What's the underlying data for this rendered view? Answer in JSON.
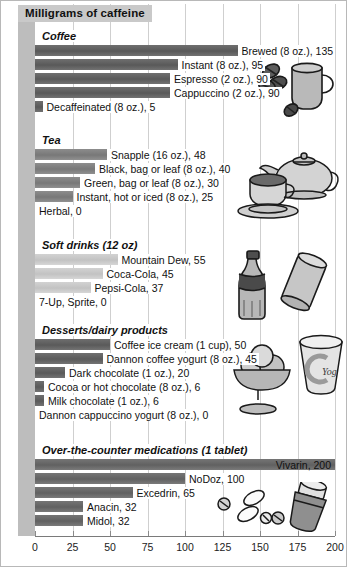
{
  "title": "Milligrams of caffeine",
  "chart_data": {
    "type": "bar",
    "title": "Milligrams of caffeine",
    "xlabel": "",
    "ylabel": "",
    "xlim": [
      0,
      200
    ],
    "orientation": "horizontal",
    "grid": true,
    "legend": "none",
    "xticks": [
      "0",
      "25",
      "50",
      "75",
      "100",
      "125",
      "150",
      "175",
      "200"
    ],
    "xtick_values": [
      0,
      25,
      50,
      75,
      100,
      125,
      150,
      175,
      200
    ],
    "groups": [
      {
        "name": "Coffee",
        "heading": "Coffee",
        "categories": [
          "Brewed (8 oz.)",
          "Instant (8 oz.)",
          "Espresso (2 oz.)",
          "Cappuccino (2 oz.)",
          "Decaffeinated (8 oz.)"
        ],
        "values": [
          135,
          95,
          90,
          90,
          5
        ],
        "labels": [
          "Brewed (8 oz.), 135",
          "Instant (8 oz.), 95",
          "Espresso (2 oz.), 90",
          "Cappuccino (2 oz.), 90",
          "Decaffeinated (8 oz.), 5"
        ]
      },
      {
        "name": "Tea",
        "heading": "Tea",
        "categories": [
          "Snapple (16 oz.)",
          "Black, bag or leaf (8 oz.)",
          "Green, bag or leaf (8 oz.)",
          "Instant, hot or iced (8 oz.)",
          "Herbal"
        ],
        "values": [
          48,
          40,
          30,
          25,
          0
        ],
        "labels": [
          "Snapple (16 oz.), 48",
          "Black, bag or leaf (8 oz.), 40",
          "Green, bag or leaf (8 oz.), 30",
          "Instant, hot or iced (8 oz.), 25",
          "Herbal, 0"
        ]
      },
      {
        "name": "Soft drinks",
        "heading": "Soft drinks (12 oz)",
        "categories": [
          "Mountain Dew",
          "Coca-Cola",
          "Pepsi-Cola",
          "7-Up, Sprite"
        ],
        "values": [
          55,
          45,
          37,
          0
        ],
        "labels": [
          "Mountain Dew, 55",
          "Coca-Cola, 45",
          "Pepsi-Cola, 37",
          "7-Up, Sprite, 0"
        ]
      },
      {
        "name": "Desserts/dairy products",
        "heading": "Desserts/dairy products",
        "categories": [
          "Coffee ice cream (1 cup)",
          "Dannon coffee yogurt (8 oz.)",
          "Dark chocolate (1 oz.)",
          "Cocoa or hot chocolate (8 oz.)",
          "Milk chocolate (1 oz.)",
          "Dannon cappuccino yogurt (8 oz.)"
        ],
        "values": [
          50,
          45,
          20,
          6,
          6,
          0
        ],
        "labels": [
          "Coffee ice cream (1 cup), 50",
          "Dannon coffee yogurt (8 oz.), 45",
          "Dark chocolate (1 oz.), 20",
          "Cocoa or hot chocolate (8 oz.), 6",
          "Milk chocolate (1 oz.), 6",
          "Dannon cappuccino yogurt (8 oz.), 0"
        ]
      },
      {
        "name": "Over-the-counter medications",
        "heading": "Over-the-counter medications (1 tablet)",
        "categories": [
          "Vivarin",
          "NoDoz",
          "Excedrin",
          "Anacin",
          "Midol"
        ],
        "values": [
          200,
          100,
          65,
          32,
          32
        ],
        "labels": [
          "Vivarin, 200",
          "NoDoz, 100",
          "Excedrin, 65",
          "Anacin, 32",
          "Midol, 32"
        ]
      }
    ]
  },
  "icons": {
    "coffee": "coffee-mug-and-beans-icon",
    "tea": "teapot-and-teacup-icon",
    "soft": "soda-bottle-and-can-icon",
    "dessert": "ice-cream-bowl-and-yogurt-cup-icon",
    "meds": "pill-bottle-and-tablets-icon",
    "yogurt_label": "Yog"
  },
  "colors": {
    "coffee_bar": "#5e5e5e",
    "tea_bar": "#7e7e7e",
    "soft_bar": "#c6c6c6",
    "dessert_bar": "#5e5e5e",
    "meds_bar": "#686868",
    "title_bg": "#c9c9c9",
    "margin_strip": "#bdbdbd",
    "gridline": "#cfcfcf"
  }
}
